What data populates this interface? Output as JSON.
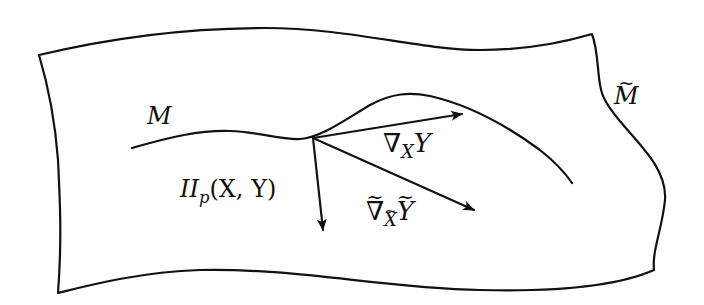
{
  "diagram": {
    "type": "differential-geometry-submanifold",
    "ambient_manifold": {
      "label": "M",
      "accent": "tilde"
    },
    "submanifold_curve": {
      "label": "M"
    },
    "point": {
      "name": "p"
    },
    "vectors": [
      {
        "id": "levi-civita-sub",
        "label_main": "∇",
        "label_sub": "X",
        "label_arg": "Y"
      },
      {
        "id": "second-fundamental-form",
        "label_main": "II",
        "label_sub": "p",
        "label_args": "(X, Y)"
      },
      {
        "id": "levi-civita-ambient",
        "label_main": "∇",
        "label_sub": "X",
        "label_arg": "Y",
        "tilde": "~"
      }
    ],
    "colors": {
      "stroke": "#111111",
      "background": "#ffffff"
    }
  }
}
